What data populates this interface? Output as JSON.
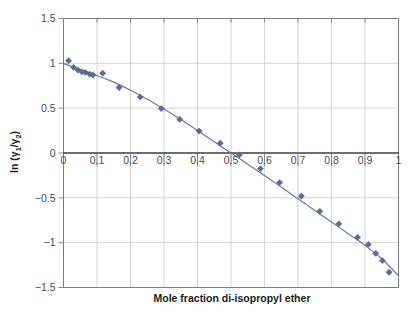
{
  "chart_data": {
    "type": "scatter",
    "title": "",
    "xlabel": "Mole fraction di-isopropyl ether",
    "ylabel": "ln (γ1/γ2)",
    "ylabel_parts": {
      "prefix": "ln (",
      "gamma1": "γ",
      "sub1": "1",
      "slash": "/",
      "gamma2": "γ",
      "sub2": "2",
      "suffix": ")"
    },
    "xlim": [
      0,
      1
    ],
    "ylim": [
      -1.5,
      1.5
    ],
    "xticks": [
      0,
      0.1,
      0.2,
      0.3,
      0.4,
      0.5,
      0.6,
      0.7,
      0.8,
      0.9,
      1
    ],
    "xtick_labels": [
      "0",
      "0.1",
      "0.2",
      "0.3",
      "0.4",
      "0.5",
      "0.6",
      "0.7",
      "0.8",
      "0.9",
      "1"
    ],
    "yticks": [
      1.5,
      1,
      0.5,
      0,
      -0.5,
      -1,
      -1.5
    ],
    "ytick_labels": [
      "1.5",
      "1",
      "0.5",
      "0",
      "−0.5",
      "−1",
      "−1.5"
    ],
    "grid": true,
    "legend": null,
    "marker": "diamond",
    "marker_color": "#5d6c8e",
    "line_color": "#6b7898",
    "grid_color": "#c9c9c9",
    "axis_color": "#7a7a7a",
    "zero_line_color": "#3d3d3d",
    "series": [
      {
        "name": "measured",
        "kind": "scatter",
        "x": [
          0.015,
          0.03,
          0.043,
          0.055,
          0.065,
          0.078,
          0.088,
          0.117,
          0.166,
          0.229,
          0.292,
          0.347,
          0.405,
          0.468,
          0.525,
          0.588,
          0.645,
          0.71,
          0.765,
          0.822,
          0.878,
          0.91,
          0.932,
          0.952,
          0.972
        ],
        "y": [
          1.03,
          0.955,
          0.925,
          0.905,
          0.9,
          0.88,
          0.87,
          0.89,
          0.73,
          0.625,
          0.495,
          0.375,
          0.245,
          0.11,
          -0.02,
          -0.175,
          -0.33,
          -0.48,
          -0.65,
          -0.79,
          -0.94,
          -1.02,
          -1.12,
          -1.2,
          -1.33
        ]
      },
      {
        "name": "fit",
        "kind": "line",
        "x": [
          0.0,
          0.05,
          0.1,
          0.15,
          0.2,
          0.25,
          0.3,
          0.35,
          0.4,
          0.45,
          0.5,
          0.55,
          0.6,
          0.65,
          0.7,
          0.75,
          0.8,
          0.85,
          0.9,
          0.95,
          1.0
        ],
        "y": [
          1.0,
          0.93,
          0.865,
          0.79,
          0.7,
          0.6,
          0.49,
          0.375,
          0.25,
          0.125,
          0.0,
          -0.125,
          -0.25,
          -0.38,
          -0.51,
          -0.64,
          -0.77,
          -0.9,
          -1.03,
          -1.18,
          -1.37
        ]
      }
    ]
  }
}
